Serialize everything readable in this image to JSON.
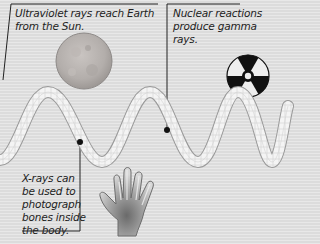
{
  "diagram": {
    "colors": {
      "background": "#dcdcdc",
      "wave_fill": "#f2f2f2",
      "wave_edge": "#9a9a9a",
      "callout_line": "#222222",
      "sun": "#b8b3b0",
      "radiation_symbol": "#111111"
    },
    "callouts": [
      {
        "id": "ultraviolet",
        "lines": [
          "Ultraviolet rays reach Earth",
          "from the Sun."
        ],
        "icon": "sun-icon"
      },
      {
        "id": "gamma",
        "lines": [
          "Nuclear reactions",
          "produce gamma",
          "rays."
        ],
        "icon": "radiation-icon"
      },
      {
        "id": "xray",
        "lines": [
          "X-rays can",
          "be used to",
          "photograph",
          "bones inside",
          "the body."
        ],
        "icon": "xray-hand-icon"
      }
    ]
  }
}
